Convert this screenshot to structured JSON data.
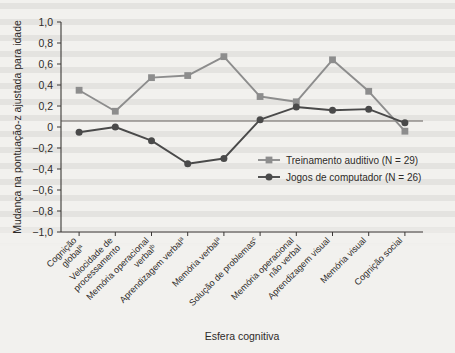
{
  "chart_data": {
    "type": "line",
    "title": "",
    "xlabel": "Esfera cognitiva",
    "ylabel": "Mudança na pontuação-z ajustada para idade",
    "ylim": [
      -1.0,
      1.0
    ],
    "yticks": [
      "1,0",
      "0,8",
      "0,6",
      "0,4",
      "0,2",
      "0",
      "-0,2",
      "-0,4",
      "-0,6",
      "-0,8",
      "-1,0"
    ],
    "ytick_values": [
      1.0,
      0.8,
      0.6,
      0.4,
      0.2,
      0,
      -0.2,
      -0.4,
      -0.6,
      -0.8,
      -1.0
    ],
    "grid": false,
    "legend_position": "center-right",
    "zero_line": true,
    "categories": [
      "Cognição global",
      "Velocidade de processamento",
      "Memória operacional verbal",
      "Aprendizagem verbal",
      "Memória verbal",
      "Solução de problemas",
      "Memória operacional não verbal",
      "Aprendizagem visual",
      "Memória visual",
      "Cognição social"
    ],
    "category_superscripts": [
      "a",
      "",
      "b",
      "a",
      "a",
      "c",
      "",
      "",
      "",
      ""
    ],
    "series": [
      {
        "name": "Treinamento auditivo (N = 29)",
        "color": "#8d8d8d",
        "marker": "square",
        "values": [
          0.35,
          0.15,
          0.47,
          0.49,
          0.67,
          0.29,
          0.24,
          0.64,
          0.34,
          -0.04
        ]
      },
      {
        "name": "Jogos de computador (N = 26)",
        "color": "#4a4a4a",
        "marker": "circle",
        "values": [
          -0.05,
          0.0,
          -0.13,
          -0.35,
          -0.3,
          0.07,
          0.19,
          0.16,
          0.17,
          0.04
        ]
      }
    ]
  },
  "legend": {
    "items": [
      {
        "label": "Treinamento auditivo (N = 29)",
        "color": "#8d8d8d",
        "marker": "square"
      },
      {
        "label": "Jogos de computador (N = 26)",
        "color": "#4a4a4a",
        "marker": "circle"
      }
    ]
  },
  "axes": {
    "y_title": "Mudança na pontuação-z ajustada para idade",
    "x_title": "Esfera cognitiva"
  },
  "colors": {
    "background": "#f2f1ee",
    "axis": "#3a3735",
    "series_auditory": "#8d8d8d",
    "series_games": "#4a4a4a"
  }
}
